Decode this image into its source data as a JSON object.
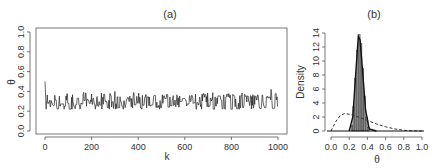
{
  "chart_data": [
    {
      "type": "line",
      "title": "(a)",
      "xlabel": "k",
      "ylabel": "θ",
      "xlim": [
        0,
        1000
      ],
      "ylim": [
        0,
        1
      ],
      "xticks": [
        "0",
        "200",
        "400",
        "600",
        "800",
        "1000"
      ],
      "yticks": [
        "0.0",
        "0.2",
        "0.4",
        "0.6",
        "0.8",
        "1.0"
      ],
      "grid": false,
      "series": [
        {
          "name": "trace",
          "description": "MCMC trace starting near 0.5 then fluctuating around 0.3 (range ~0.22–0.42)",
          "start_value": 0.5,
          "mean": 0.3,
          "min": 0.22,
          "max": 0.42
        }
      ]
    },
    {
      "type": "bar",
      "title": "(b)",
      "xlabel": "θ",
      "ylabel": "Density",
      "xlim": [
        0,
        1
      ],
      "ylim": [
        0,
        14
      ],
      "xticks": [
        "0.0",
        "0.2",
        "0.4",
        "0.6",
        "0.8",
        "1.0"
      ],
      "yticks": [
        "0",
        "2",
        "4",
        "6",
        "8",
        "10",
        "12",
        "14"
      ],
      "grid": false,
      "histogram": {
        "bin_edges": [
          0.22,
          0.24,
          0.26,
          0.28,
          0.3,
          0.32,
          0.34,
          0.36,
          0.38,
          0.4,
          0.42
        ],
        "density": [
          0.8,
          3.5,
          7.5,
          11.5,
          13.8,
          12.5,
          9.0,
          5.0,
          2.0,
          0.5
        ]
      },
      "series": [
        {
          "name": "posterior density",
          "style": "solid",
          "x": [
            0.2,
            0.24,
            0.27,
            0.3,
            0.32,
            0.35,
            0.38,
            0.42,
            0.5
          ],
          "y": [
            0,
            2,
            8,
            13.5,
            13,
            8,
            3,
            0.3,
            0
          ]
        },
        {
          "name": "prior density",
          "style": "dashed",
          "x": [
            0.0,
            0.05,
            0.1,
            0.15,
            0.2,
            0.3,
            0.4,
            0.5,
            0.6,
            0.7,
            0.8,
            0.9,
            1.0
          ],
          "y": [
            0,
            1.3,
            2.2,
            2.5,
            2.4,
            2.0,
            1.5,
            1.0,
            0.6,
            0.3,
            0.1,
            0.02,
            0
          ]
        }
      ]
    }
  ],
  "labels": {
    "a_title": "(a)",
    "a_xlabel": "k",
    "a_ylabel": "θ",
    "b_title": "(b)",
    "b_xlabel": "θ",
    "b_ylabel": "Density"
  }
}
